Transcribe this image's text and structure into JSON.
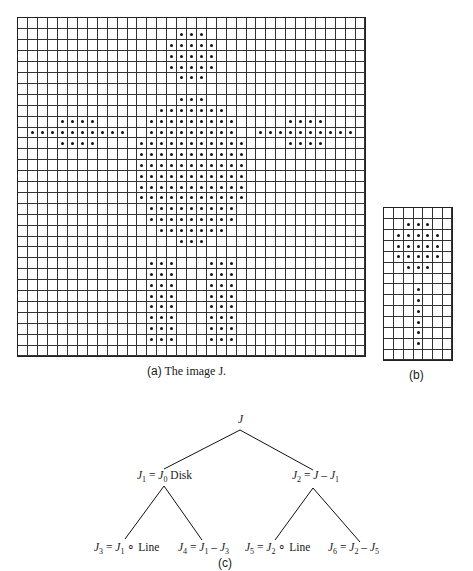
{
  "figure": {
    "image_J": {
      "caption_prefix": "(a)",
      "caption_text": " The image J.",
      "cols": 35,
      "rows": 31,
      "box": {
        "left": 17,
        "top": 17,
        "width": 349,
        "height": 340
      },
      "filled": {
        "1": [
          16,
          17,
          18
        ],
        "2": [
          15,
          16,
          17,
          18,
          19
        ],
        "3": [
          15,
          16,
          17,
          18,
          19
        ],
        "4": [
          15,
          16,
          17,
          18,
          19
        ],
        "5": [
          16,
          17,
          18
        ],
        "7": [
          16,
          17,
          18
        ],
        "8": [
          14,
          15,
          16,
          17,
          18,
          19,
          20
        ],
        "9": [
          4,
          5,
          6,
          7,
          13,
          14,
          15,
          16,
          17,
          18,
          19,
          20,
          21,
          27,
          28,
          29,
          30
        ],
        "10": [
          1,
          2,
          3,
          4,
          5,
          6,
          7,
          8,
          9,
          10,
          13,
          14,
          15,
          16,
          17,
          18,
          19,
          20,
          21,
          24,
          25,
          26,
          27,
          28,
          29,
          30,
          31,
          32,
          33
        ],
        "11": [
          4,
          5,
          6,
          7,
          12,
          13,
          14,
          15,
          16,
          17,
          18,
          19,
          20,
          21,
          22,
          27,
          28,
          29,
          30
        ],
        "12": [
          12,
          13,
          14,
          15,
          16,
          17,
          18,
          19,
          20,
          21,
          22
        ],
        "13": [
          12,
          13,
          14,
          15,
          16,
          17,
          18,
          19,
          20,
          21,
          22
        ],
        "14": [
          12,
          13,
          14,
          15,
          16,
          17,
          18,
          19,
          20,
          21,
          22
        ],
        "15": [
          12,
          13,
          14,
          15,
          16,
          17,
          18,
          19,
          20,
          21,
          22
        ],
        "16": [
          12,
          13,
          14,
          15,
          16,
          17,
          18,
          19,
          20,
          21,
          22
        ],
        "17": [
          13,
          14,
          15,
          16,
          17,
          18,
          19,
          20,
          21
        ],
        "18": [
          13,
          14,
          15,
          16,
          17,
          18,
          19,
          20,
          21
        ],
        "19": [
          14,
          15,
          16,
          17,
          18,
          19,
          20
        ],
        "20": [
          16,
          17,
          18
        ],
        "22": [
          13,
          14,
          15,
          19,
          20,
          21
        ],
        "23": [
          13,
          14,
          15,
          19,
          20,
          21
        ],
        "24": [
          13,
          14,
          15,
          19,
          20,
          21
        ],
        "25": [
          13,
          14,
          15,
          19,
          20,
          21
        ],
        "26": [
          13,
          14,
          15,
          19,
          20,
          21
        ],
        "27": [
          13,
          14,
          15,
          19,
          20,
          21
        ],
        "28": [
          13,
          14,
          15,
          19,
          20,
          21
        ],
        "29": [
          13,
          14,
          15,
          19,
          20,
          21
        ]
      }
    },
    "structuring_element": {
      "caption": "(b)",
      "cols": 7,
      "rows": 14,
      "box": {
        "left": 383,
        "top": 207,
        "width": 70,
        "height": 154
      },
      "filled": {
        "1": [
          2,
          3,
          4
        ],
        "2": [
          1,
          2,
          3,
          4,
          5
        ],
        "3": [
          1,
          2,
          3,
          4,
          5
        ],
        "4": [
          1,
          2,
          3,
          4,
          5
        ],
        "5": [
          2,
          3,
          4
        ],
        "7": [
          3
        ],
        "8": [
          3
        ],
        "9": [
          3
        ],
        "10": [
          3
        ],
        "11": [
          3
        ],
        "12": [
          3
        ]
      }
    },
    "tree": {
      "caption": "(c)",
      "root": "J",
      "nodes": {
        "j1": {
          "lhs": "J",
          "lhs_sub": "1",
          "eq": " = ",
          "rhs": "J",
          "rhs_sub": "0",
          "tail": " Disk"
        },
        "j2": {
          "lhs": "J",
          "lhs_sub": "2",
          "eq": " = ",
          "rhs": "J",
          "rhs_sub": "",
          "tail": " – ",
          "tail_var": "J",
          "tail_sub": "1"
        },
        "j3": {
          "lhs": "J",
          "lhs_sub": "3",
          "eq": " = ",
          "rhs": "J",
          "rhs_sub": "1",
          "tail": " ∘ Line"
        },
        "j4": {
          "lhs": "J",
          "lhs_sub": "4",
          "eq": " = ",
          "rhs": "J",
          "rhs_sub": "1",
          "tail": " – ",
          "tail_var": "J",
          "tail_sub": "3"
        },
        "j5": {
          "lhs": "J",
          "lhs_sub": "5",
          "eq": " = ",
          "rhs": "J",
          "rhs_sub": "2",
          "tail": " ∘ Line"
        },
        "j6": {
          "lhs": "J",
          "lhs_sub": "6",
          "eq": " = ",
          "rhs": "J",
          "rhs_sub": "2",
          "tail": " – ",
          "tail_var": "J",
          "tail_sub": "5"
        }
      },
      "edges": [
        [
          240,
          430,
          164,
          469
        ],
        [
          240,
          430,
          313,
          470
        ],
        [
          164,
          486,
          125,
          539
        ],
        [
          164,
          486,
          202,
          540
        ],
        [
          313,
          488,
          275,
          540
        ],
        [
          313,
          488,
          360,
          542
        ]
      ]
    },
    "colors": {
      "ink": "#111111",
      "grid": "#333333",
      "background": "#ffffff"
    }
  }
}
